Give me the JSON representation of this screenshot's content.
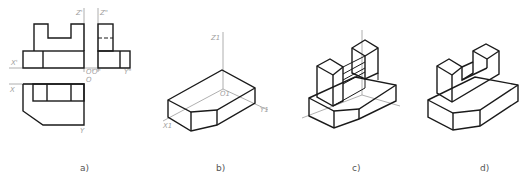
{
  "figure": {
    "panels": [
      {
        "id": "a",
        "caption": "a)",
        "description": "Three orthographic views (front, side, top) of a block with U-shaped upright",
        "axis_labels": {
          "z_front": "Z'",
          "z_side": "Z\"",
          "x_front": "X'",
          "y_side": "Y\"",
          "o_front": "O'",
          "o_side": "O\"",
          "x_top": "X",
          "o_top": "O",
          "y_top": "Y"
        }
      },
      {
        "id": "b",
        "caption": "b)",
        "description": "Isometric axes with base block (chamfered front corners)",
        "axis_labels": {
          "z": "Z1",
          "o": "O1",
          "x": "X1",
          "y": "Y1"
        }
      },
      {
        "id": "c",
        "caption": "c)",
        "description": "Isometric construction: base block with U-shaped upright added, axes visible"
      },
      {
        "id": "d",
        "caption": "d)",
        "description": "Finished isometric drawing"
      }
    ]
  }
}
